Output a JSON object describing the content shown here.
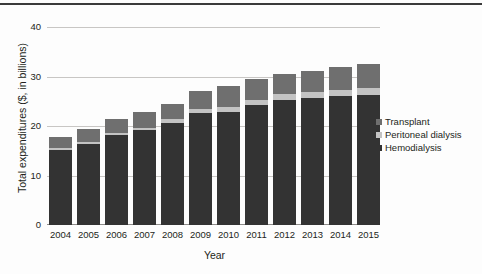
{
  "chart_data": {
    "type": "bar",
    "subtype": "stacked-vertical-bar",
    "title": "",
    "xlabel": "Year",
    "ylabel": "Total expenditures ($, in billions)",
    "categories": [
      "2004",
      "2005",
      "2006",
      "2007",
      "2008",
      "2009",
      "2010",
      "2011",
      "2012",
      "2013",
      "2014",
      "2015"
    ],
    "ylim": [
      0,
      40
    ],
    "yticks": [
      0,
      10,
      20,
      30,
      40
    ],
    "ytick_labels": [
      "0",
      "10",
      "20",
      "30",
      "40"
    ],
    "grid": "horizontal",
    "legend_position": "right-inside",
    "stack_order_bottom_to_top": [
      "Hemodialysis",
      "Peritoneal dialysis",
      "Transplant"
    ],
    "series": [
      {
        "name": "Hemodialysis",
        "color": "#333333",
        "values": [
          15.2,
          16.3,
          18.1,
          19.1,
          20.6,
          22.6,
          22.9,
          24.3,
          25.3,
          25.6,
          26.0,
          26.2
        ]
      },
      {
        "name": "Peritoneal dialysis",
        "color": "#c3c3c3",
        "values": [
          0.4,
          0.5,
          0.5,
          0.5,
          0.8,
          0.9,
          1.0,
          1.0,
          1.1,
          1.2,
          1.3,
          1.4
        ]
      },
      {
        "name": "Transplant",
        "color": "#6f6f6f",
        "values": [
          2.2,
          2.5,
          2.9,
          3.2,
          3.1,
          3.6,
          4.2,
          4.3,
          4.2,
          4.3,
          4.6,
          5.0
        ]
      }
    ],
    "totals": [
      17.8,
      19.3,
      21.5,
      22.8,
      24.5,
      27.1,
      28.1,
      29.6,
      30.6,
      31.1,
      31.9,
      32.6
    ]
  },
  "axes": {
    "y_title": "Total expenditures ($, in billions)",
    "x_title": "Year",
    "y_tick_labels": [
      "40",
      "30",
      "20",
      "10",
      "0"
    ],
    "x_tick_labels": [
      "2004",
      "2005",
      "2006",
      "2007",
      "2008",
      "2009",
      "2010",
      "2011",
      "2012",
      "2013",
      "2014",
      "2015"
    ]
  },
  "legend": {
    "items": [
      {
        "label": "Transplant",
        "color": "#6f6f6f"
      },
      {
        "label": "Peritoneal dialysis",
        "color": "#c3c3c3"
      },
      {
        "label": "Hemodialysis",
        "color": "#333333"
      }
    ]
  },
  "colors": {
    "transplant": "#6f6f6f",
    "peritoneal_dialysis": "#c3c3c3",
    "hemodialysis": "#333333",
    "gridline": "#c8c6c4",
    "axis": "#8d8b89",
    "text": "#231f20",
    "background": "#fdfdfd",
    "top_rule": "#3b3b3b"
  }
}
